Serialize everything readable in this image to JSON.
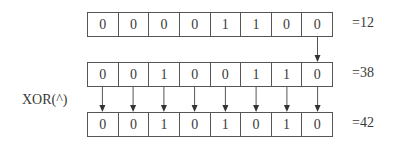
{
  "rows": [
    {
      "bits": [
        "0",
        "0",
        "0",
        "0",
        "1",
        "1",
        "0",
        "0"
      ],
      "value_label": "=12"
    },
    {
      "bits": [
        "0",
        "0",
        "1",
        "0",
        "0",
        "1",
        "1",
        "0"
      ],
      "value_label": "=38"
    },
    {
      "bits": [
        "0",
        "0",
        "1",
        "0",
        "1",
        "0",
        "1",
        "0"
      ],
      "value_label": "=42"
    }
  ],
  "operation_label": "XOR(^)",
  "colors": {
    "line": "#555555",
    "text": "#3a3a3a"
  }
}
